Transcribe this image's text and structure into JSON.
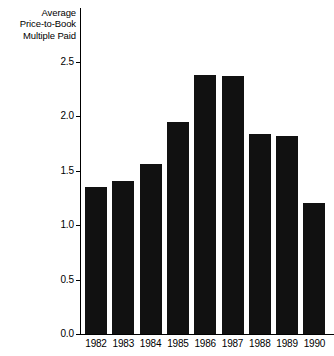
{
  "chart_data": {
    "type": "bar",
    "title": "Average\nPrice-to-Book\nMultiple Paid",
    "title_lines": [
      "Average",
      "Price-to-Book",
      "Multiple Paid"
    ],
    "xlabel": "",
    "ylabel": "Average Price-to-Book Multiple Paid",
    "categories": [
      "1982",
      "1983",
      "1984",
      "1985",
      "1986",
      "1987",
      "1988",
      "1989",
      "1990"
    ],
    "values": [
      1.35,
      1.41,
      1.56,
      1.95,
      2.38,
      2.37,
      1.84,
      1.82,
      1.2
    ],
    "ylim": [
      0.0,
      2.5
    ],
    "ytick_labels": [
      "0.0",
      "0.5",
      "1.0",
      "1.5",
      "2.0",
      "2.5"
    ],
    "ytick_values": [
      0.0,
      0.5,
      1.0,
      1.5,
      2.0,
      2.5
    ],
    "grid": false,
    "legend": null,
    "bar_color": "#111111",
    "axis_color": "#000000",
    "background_color": "#ffffff"
  }
}
